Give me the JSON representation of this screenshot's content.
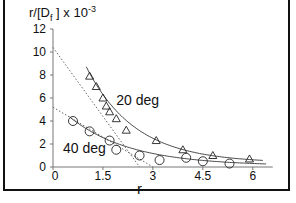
{
  "chart_data": {
    "type": "scatter",
    "title": "",
    "xlabel": "r",
    "ylabel": "r/[Df] x 10^-3",
    "ylabel_parts": {
      "main": "r/[D",
      "sub": "f",
      "close": " ] x 10",
      "exp": "-3"
    },
    "xlim": [
      0,
      6.6
    ],
    "ylim": [
      0,
      12
    ],
    "x_ticks": [
      0,
      1.5,
      3,
      4.5,
      6
    ],
    "x_tick_labels": [
      "0",
      "1.5",
      "3",
      "4.5",
      "6"
    ],
    "y_ticks": [
      0,
      2,
      4,
      6,
      8,
      10,
      12
    ],
    "y_tick_labels": [
      "0",
      "2",
      "4",
      "6",
      "8",
      "10",
      "12"
    ],
    "grid": false,
    "legend": "none (inline annotations)",
    "annotations": [
      "20 deg",
      "40 deg"
    ],
    "series": [
      {
        "name": "20 deg",
        "marker": "triangle",
        "x": [
          1.1,
          1.3,
          1.5,
          1.6,
          1.7,
          1.9,
          2.2,
          3.1,
          3.9,
          4.8,
          5.9
        ],
        "y": [
          7.9,
          7.0,
          6.0,
          5.3,
          4.8,
          4.2,
          3.2,
          2.3,
          1.5,
          1.0,
          0.7
        ],
        "fit_curve": "exponential-like decay",
        "tangent_line": {
          "x": [
            0,
            2.6
          ],
          "y": [
            10.4,
            0
          ]
        }
      },
      {
        "name": "40 deg",
        "marker": "circle",
        "x": [
          0.6,
          1.1,
          1.7,
          1.9,
          2.6,
          3.2,
          4.0,
          4.5,
          5.3
        ],
        "y": [
          4.0,
          3.1,
          2.3,
          1.5,
          1.0,
          0.6,
          0.8,
          0.5,
          0.3
        ],
        "fit_curve": "exponential-like decay",
        "tangent_line": {
          "x": [
            0,
            3.0
          ],
          "y": [
            5.2,
            0
          ]
        }
      }
    ]
  },
  "caption_partial": "Figure ..."
}
